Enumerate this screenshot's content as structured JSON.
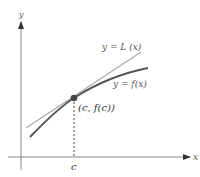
{
  "diagram": {
    "axes": {
      "x_label": "x",
      "y_label": "y",
      "axis_color": "#8a8a8a"
    },
    "curves": {
      "tangent_label": "y = L (x)",
      "function_label": "y = f(x)",
      "tangent_color": "#a9a9a9",
      "function_color": "#555555"
    },
    "point": {
      "label": "(c, f(c))",
      "color": "#444444"
    },
    "tick": {
      "label": "c"
    }
  }
}
